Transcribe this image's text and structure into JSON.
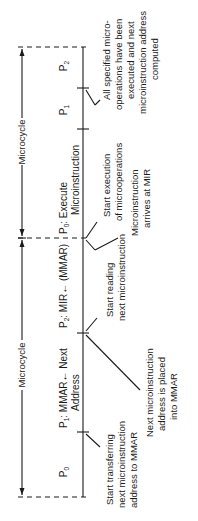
{
  "diagram": {
    "cycles": [
      {
        "label": "Microcycle"
      },
      {
        "label": "Microcycle"
      }
    ],
    "phases": [
      {
        "id": "p0a",
        "name": "P",
        "sub": "0",
        "text": ""
      },
      {
        "id": "p1a",
        "name": "P",
        "sub": "1",
        "text": ": MMAR← Next",
        "text2": "Address"
      },
      {
        "id": "p2a",
        "name": "P",
        "sub": "2",
        "text": ": MIR← (MMAR)"
      },
      {
        "id": "p0b",
        "name": "P",
        "sub": "0",
        "text": ": Execute",
        "text2": "Microinstruction"
      },
      {
        "id": "p1b",
        "name": "P",
        "sub": "1",
        "text": ""
      },
      {
        "id": "p2b",
        "name": "P",
        "sub": "2",
        "text": ""
      }
    ],
    "annotations": [
      {
        "id": "start-transfer",
        "lines": [
          "Start transferring",
          "next microinstruction",
          "address to MMAR"
        ]
      },
      {
        "id": "next-addr-placed",
        "lines": [
          "Next microinstruction",
          "address is placed",
          "into MMAR"
        ]
      },
      {
        "id": "start-reading",
        "lines": [
          "Start reading",
          "next microinstruction"
        ]
      },
      {
        "id": "start-exec",
        "lines": [
          "Start execution",
          "of microoperations"
        ]
      },
      {
        "id": "arrives-mir",
        "lines": [
          "Microinstruction",
          "arrives at MIR"
        ]
      },
      {
        "id": "all-executed",
        "lines": [
          "All specified micro-",
          "operations have been",
          "executed and next",
          "microinstruction address",
          "computed"
        ]
      }
    ]
  }
}
